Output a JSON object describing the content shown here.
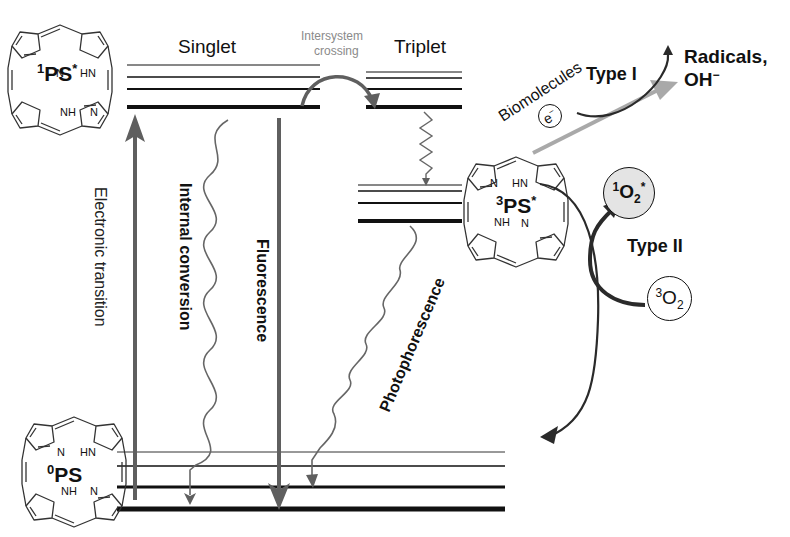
{
  "diagram": {
    "type": "Jablonski diagram (photodynamic therapy mechanism)",
    "colors": {
      "line": "#111111",
      "gray_arrow": "#5f5f5f",
      "light_gray_arrow": "#a9a9a9",
      "singlet_oxygen_fill": "#e4e4e4",
      "muted_text": "#8a8a8a"
    },
    "states": {
      "singlet_excited": {
        "sup": "1",
        "name": "PS",
        "mark": "*"
      },
      "triplet_excited": {
        "sup": "3",
        "name": "PS",
        "mark": "*"
      },
      "ground": {
        "sup": "0",
        "name": "PS",
        "mark": ""
      }
    },
    "level_labels": {
      "singlet": "Singlet",
      "triplet": "Triplet"
    },
    "transitions": {
      "intersystem_crossing_line1": "Intersystem",
      "intersystem_crossing_line2": "crossing",
      "electronic_transition": "Electronic transition",
      "internal_conversion": "Internal conversion",
      "fluorescence": "Fluorescence",
      "phosphorescence": "Photophorescence"
    },
    "type_i": {
      "label": "Type I",
      "substrate": "Biomolecules",
      "electron": "e",
      "electron_charge": "−",
      "product_line1": "Radicals,",
      "product_line2": "OH",
      "product_charge": "−"
    },
    "type_ii": {
      "label": "Type II",
      "singlet_oxygen": {
        "sup": "1",
        "name": "O",
        "sub": "2",
        "mark": "*"
      },
      "triplet_oxygen": {
        "sup": "3",
        "name": "O",
        "sub": "2"
      }
    },
    "porphyrin_atoms": {
      "n": "N",
      "hn": "HN",
      "nh": "NH"
    }
  }
}
